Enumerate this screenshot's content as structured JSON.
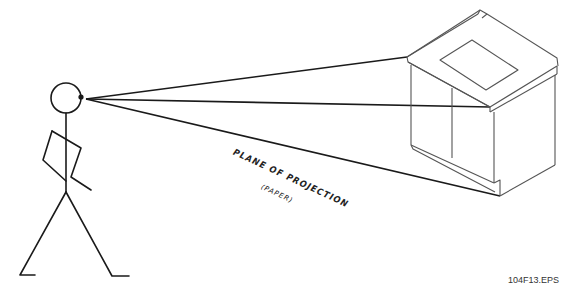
{
  "diagram": {
    "labels": {
      "plane": "PLANE OF PROJECTION",
      "paper": "(PAPER)"
    },
    "figure_id": "104F13.EPS",
    "elements": [
      "stick-figure-observer",
      "sight-lines",
      "cabinet"
    ],
    "colors": {
      "stroke": "#1a1a1a",
      "cabinet_stroke": "#555555",
      "background": "#ffffff"
    }
  }
}
